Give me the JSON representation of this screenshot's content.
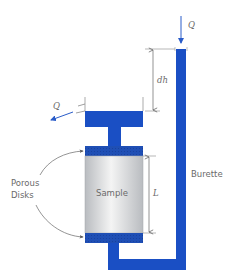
{
  "diagram": {
    "labels": {
      "q_in": "Q",
      "q_out": "Q",
      "dh": "dh",
      "length": "L",
      "sample": "Sample",
      "burette": "Burette",
      "porous_line1": "Porous",
      "porous_line2": "Disks"
    },
    "colors": {
      "water": "#1a4fc4",
      "disk": "#1f4fb5",
      "sample_light": "#f2f2f2",
      "sample_dark": "#b9bcc0",
      "line": "#7a7a7a",
      "text": "#6a6a6a"
    }
  }
}
